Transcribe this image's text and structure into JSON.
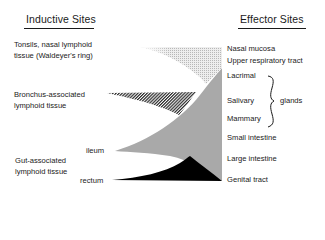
{
  "left_header": "Inductive Sites",
  "right_header": "Effector Sites",
  "inductive_sites": {
    "tonsils": [
      "Tonsils, nasal lymphoid",
      "tissue (Waldeyer's ring)"
    ],
    "bronchus": [
      "Bronchus-associated",
      "lymphoid tissue"
    ],
    "gut": [
      "Gut-associated",
      "lymphoid tissue"
    ],
    "gut_sub": {
      "ileum": "ileum",
      "rectum": "rectum"
    }
  },
  "effector_sites": {
    "nasal": "Nasal mucosa",
    "upper_resp": "Upper respiratory tract",
    "lacrimal": "Lacrimal",
    "salivary": "Salivary",
    "mammary": "Mammary",
    "glands": "glands",
    "small_int": "Small intestine",
    "large_int": "Large intestine",
    "genital": "Genital tract"
  },
  "colors": {
    "text": "#1a1a1a",
    "tonsil_fill": "#d9d9d9",
    "bronchus_fill": "#3a3a3a",
    "ileum_fill": "#aaaaaa",
    "rectum_fill": "#000000"
  }
}
